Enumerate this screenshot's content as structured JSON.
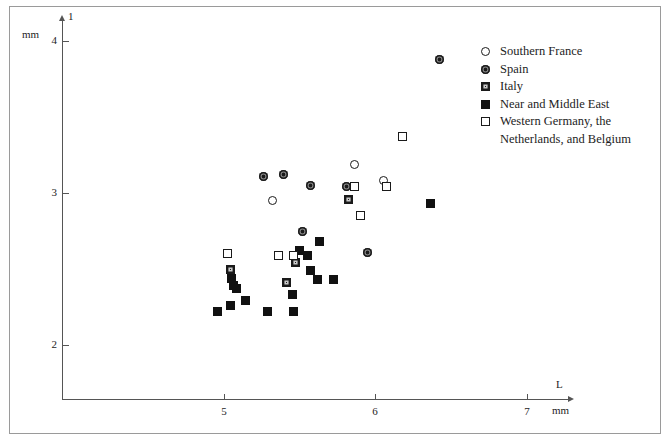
{
  "chart_data": {
    "type": "scatter",
    "title": "",
    "xlabel": "L",
    "ylabel": "1",
    "x_unit": "mm",
    "y_unit": "mm",
    "xlim": [
      4.55,
      7.45
    ],
    "ylim": [
      1.72,
      4.2
    ],
    "xticks": [
      5,
      6,
      7
    ],
    "yticks": [
      2,
      3,
      4
    ],
    "grid": false,
    "legend_position": "upper right",
    "series": [
      {
        "name": "Southern France",
        "marker": "circle-open",
        "points": [
          {
            "x": 5.32,
            "y": 2.95
          },
          {
            "x": 5.86,
            "y": 3.19
          },
          {
            "x": 6.05,
            "y": 3.08
          }
        ]
      },
      {
        "name": "Spain",
        "marker": "circle-filled",
        "points": [
          {
            "x": 6.42,
            "y": 3.88
          },
          {
            "x": 5.26,
            "y": 3.11
          },
          {
            "x": 5.39,
            "y": 3.12
          },
          {
            "x": 5.57,
            "y": 3.05
          },
          {
            "x": 5.81,
            "y": 3.04
          },
          {
            "x": 5.52,
            "y": 2.75
          },
          {
            "x": 5.95,
            "y": 2.61
          }
        ]
      },
      {
        "name": "Italy",
        "marker": "square-half",
        "points": [
          {
            "x": 5.82,
            "y": 2.96
          },
          {
            "x": 5.04,
            "y": 2.5
          },
          {
            "x": 5.47,
            "y": 2.54
          },
          {
            "x": 5.41,
            "y": 2.41
          }
        ]
      },
      {
        "name": "Near and Middle East",
        "marker": "square-filled",
        "points": [
          {
            "x": 6.36,
            "y": 2.93
          },
          {
            "x": 5.63,
            "y": 2.68
          },
          {
            "x": 5.05,
            "y": 2.44
          },
          {
            "x": 5.06,
            "y": 2.39
          },
          {
            "x": 5.08,
            "y": 2.37
          },
          {
            "x": 5.14,
            "y": 2.29
          },
          {
            "x": 5.04,
            "y": 2.26
          },
          {
            "x": 4.96,
            "y": 2.22
          },
          {
            "x": 5.29,
            "y": 2.22
          },
          {
            "x": 5.5,
            "y": 2.62
          },
          {
            "x": 5.55,
            "y": 2.59
          },
          {
            "x": 5.57,
            "y": 2.49
          },
          {
            "x": 5.62,
            "y": 2.43
          },
          {
            "x": 5.72,
            "y": 2.43
          },
          {
            "x": 5.45,
            "y": 2.33
          },
          {
            "x": 5.46,
            "y": 2.22
          }
        ]
      },
      {
        "name": "Western Germany, the Netherlands, and Belgium",
        "marker": "square-open",
        "points": [
          {
            "x": 6.18,
            "y": 3.37
          },
          {
            "x": 5.86,
            "y": 3.04
          },
          {
            "x": 6.07,
            "y": 3.04
          },
          {
            "x": 5.9,
            "y": 2.85
          },
          {
            "x": 5.02,
            "y": 2.6
          },
          {
            "x": 5.36,
            "y": 2.59
          },
          {
            "x": 5.46,
            "y": 2.59
          }
        ]
      }
    ]
  },
  "axes": {
    "y_unit_label": "mm",
    "y_name_label": "1",
    "x_name_label": "L",
    "x_unit_label": "mm",
    "ytick_labels": [
      "4",
      "3",
      "2"
    ],
    "xtick_labels": [
      "5",
      "6",
      "7"
    ]
  },
  "legend": {
    "items": [
      {
        "label": "Southern France",
        "marker": "circle-open"
      },
      {
        "label": "Spain",
        "marker": "circle-filled"
      },
      {
        "label": "Italy",
        "marker": "square-half"
      },
      {
        "label": "Near and Middle East",
        "marker": "square-filled"
      },
      {
        "label": "Western Germany, the",
        "marker": "square-open"
      },
      {
        "label": "Netherlands, and Belgium",
        "marker": "none"
      }
    ]
  }
}
